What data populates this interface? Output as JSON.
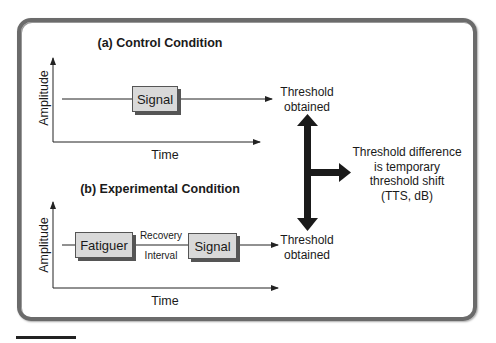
{
  "panels": {
    "control": {
      "title": "(a) Control Condition",
      "y_label": "Amplitude",
      "x_label": "Time",
      "signal_label": "Signal"
    },
    "experimental": {
      "title": "(b) Experimental Condition",
      "y_label": "Amplitude",
      "x_label": "Time",
      "fatiguer_label": "Fatiguer",
      "recovery_label": "Recovery",
      "interval_label": "Interval",
      "signal_label": "Signal"
    }
  },
  "threshold_top": [
    "Threshold",
    "obtained"
  ],
  "threshold_bottom": [
    "Threshold",
    "obtained"
  ],
  "result_text": [
    "Threshold difference",
    "is temporary",
    "threshold shift",
    "(TTS, dB)"
  ],
  "colors": {
    "frame": "#6b6b6b",
    "box_fill": "#d9d9d9",
    "arrow": "#1a1a1a"
  }
}
